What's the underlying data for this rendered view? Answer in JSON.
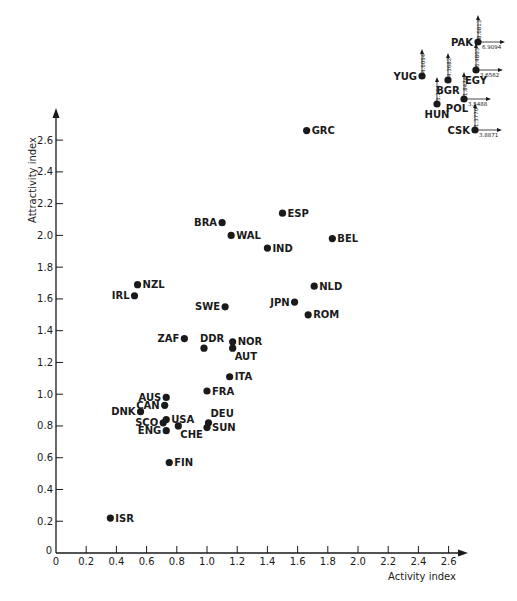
{
  "chart_data": {
    "type": "scatter",
    "title": "",
    "xlabel": "Activity index",
    "ylabel": "Attractivity index",
    "xlim": [
      0,
      2.6
    ],
    "ylim": [
      0,
      2.6
    ],
    "grid": false,
    "x_ticks": [
      "0",
      "0.2",
      "0.4",
      "0.6",
      "0.8",
      "1.0",
      "1.2",
      "1.4",
      "1.6",
      "1.8",
      "2.0",
      "2.2",
      "2.4",
      "2.6"
    ],
    "y_ticks": [
      "0",
      "0.2",
      "0.4",
      "0.6",
      "0.8",
      "1.0",
      "1.2",
      "1.4",
      "1.6",
      "1.8",
      "2.0",
      "2.2",
      "2.4",
      "2.6"
    ],
    "points": [
      {
        "label": "GRC",
        "x": 1.66,
        "y": 2.66,
        "label_side": "right"
      },
      {
        "label": "ESP",
        "x": 1.5,
        "y": 2.14,
        "label_side": "right"
      },
      {
        "label": "BRA",
        "x": 1.1,
        "y": 2.08,
        "label_side": "left"
      },
      {
        "label": "WAL",
        "x": 1.16,
        "y": 2.0,
        "label_side": "right"
      },
      {
        "label": "IND",
        "x": 1.4,
        "y": 1.92,
        "label_side": "right"
      },
      {
        "label": "BEL",
        "x": 1.83,
        "y": 1.98,
        "label_side": "right"
      },
      {
        "label": "NZL",
        "x": 0.54,
        "y": 1.69,
        "label_side": "right"
      },
      {
        "label": "IRL",
        "x": 0.52,
        "y": 1.62,
        "label_side": "left"
      },
      {
        "label": "SWE",
        "x": 1.12,
        "y": 1.55,
        "label_side": "left"
      },
      {
        "label": "JPN",
        "x": 1.58,
        "y": 1.58,
        "label_side": "left"
      },
      {
        "label": "NLD",
        "x": 1.71,
        "y": 1.68,
        "label_side": "right"
      },
      {
        "label": "ROM",
        "x": 1.67,
        "y": 1.5,
        "label_side": "right"
      },
      {
        "label": "ZAF",
        "x": 0.85,
        "y": 1.35,
        "label_side": "left"
      },
      {
        "label": "DDR",
        "x": 0.98,
        "y": 1.29,
        "label_side": "above"
      },
      {
        "label": "NOR",
        "x": 1.17,
        "y": 1.33,
        "label_side": "right"
      },
      {
        "label": "AUT",
        "x": 1.17,
        "y": 1.29,
        "label_side": "below-right"
      },
      {
        "label": "ITA",
        "x": 1.15,
        "y": 1.11,
        "label_side": "right"
      },
      {
        "label": "FRA",
        "x": 1.0,
        "y": 1.02,
        "label_side": "right"
      },
      {
        "label": "AUS",
        "x": 0.73,
        "y": 0.98,
        "label_side": "left"
      },
      {
        "label": "CAN",
        "x": 0.72,
        "y": 0.93,
        "label_side": "left"
      },
      {
        "label": "DNK",
        "x": 0.56,
        "y": 0.89,
        "label_side": "left"
      },
      {
        "label": "USA",
        "x": 0.73,
        "y": 0.84,
        "label_side": "right"
      },
      {
        "label": "SCO",
        "x": 0.71,
        "y": 0.82,
        "label_side": "left"
      },
      {
        "label": "ENG",
        "x": 0.73,
        "y": 0.77,
        "label_side": "left"
      },
      {
        "label": "CHE",
        "x": 0.81,
        "y": 0.8,
        "label_side": "below-right"
      },
      {
        "label": "DEU",
        "x": 1.01,
        "y": 0.82,
        "label_side": "above-right"
      },
      {
        "label": "SUN",
        "x": 1.0,
        "y": 0.79,
        "label_side": "right"
      },
      {
        "label": "FIN",
        "x": 0.75,
        "y": 0.57,
        "label_side": "right"
      },
      {
        "label": "ISR",
        "x": 0.36,
        "y": 0.22,
        "label_side": "right"
      }
    ],
    "off_scale_points": [
      {
        "label": "PAK",
        "x_value": "6.9094",
        "y_value": "8.6813",
        "label_side": "left"
      },
      {
        "label": "YUG",
        "x_value": "",
        "y_value": "4.6094",
        "label_side": "left"
      },
      {
        "label": "BGR",
        "x_value": "",
        "y_value": "4.3682",
        "label_side": "below"
      },
      {
        "label": "EGY",
        "x_value": "3.6562",
        "y_value": "6.4803",
        "label_side": "below"
      },
      {
        "label": "HUN",
        "x_value": "",
        "y_value": "3.244",
        "label_side": "below"
      },
      {
        "label": "POL",
        "x_value": "3.5488",
        "y_value": "1.8474",
        "label_side": "below-left"
      },
      {
        "label": "CSK",
        "x_value": "3.8871",
        "y_value": "1.3770",
        "label_side": "left"
      }
    ]
  }
}
